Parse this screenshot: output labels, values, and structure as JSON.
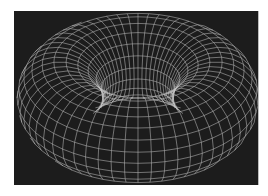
{
  "image": {
    "subject": "wireframe torus mesh",
    "colors": {
      "background": "#ffffff",
      "panel": "#1c1c1c",
      "wire": "#c8c8c8"
    },
    "torus": {
      "center": [
        124,
        100
      ],
      "outer_rx": 100,
      "outer_ry": 70,
      "hole_center": [
        141,
        88
      ],
      "hole_rx": 40,
      "hole_ry": 17,
      "rings": 14,
      "segments": 48
    }
  }
}
